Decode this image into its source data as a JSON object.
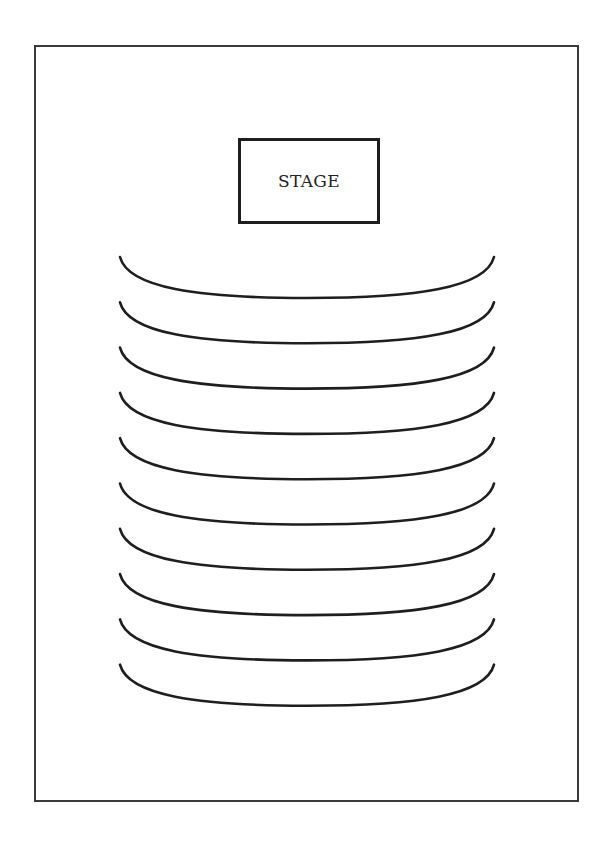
{
  "diagram": {
    "type": "seating-layout",
    "stage": {
      "label": "STAGE"
    },
    "seating_rows": {
      "count": 10,
      "shape": "concave arc facing stage",
      "stroke_color": "#1e1e1e"
    },
    "colors": {
      "background": "#ffffff",
      "frame_border": "#3a3a3a",
      "stroke": "#1e1e1e"
    }
  }
}
